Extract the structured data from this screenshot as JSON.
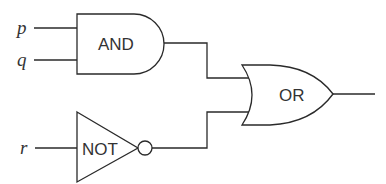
{
  "diagram": {
    "type": "logic-circuit",
    "inputs": [
      {
        "name": "p",
        "label": "p"
      },
      {
        "name": "q",
        "label": "q"
      },
      {
        "name": "r",
        "label": "r"
      }
    ],
    "gates": [
      {
        "id": "and",
        "type": "AND",
        "label": "AND",
        "inputs": [
          "p",
          "q"
        ]
      },
      {
        "id": "not",
        "type": "NOT",
        "label": "NOT",
        "inputs": [
          "r"
        ]
      },
      {
        "id": "or",
        "type": "OR",
        "label": "OR",
        "inputs": [
          "and",
          "not"
        ]
      }
    ],
    "output": {
      "from": "or"
    },
    "colors": {
      "stroke": "#2a2a2a",
      "text": "#333333",
      "background": "#ffffff"
    }
  }
}
